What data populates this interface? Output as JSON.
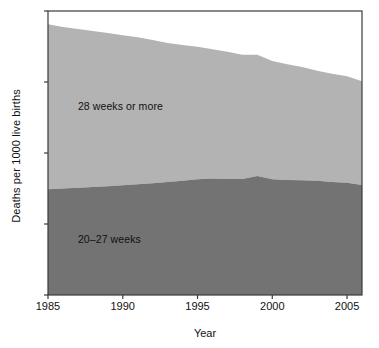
{
  "chart_data": {
    "type": "area",
    "stacked": true,
    "title": "",
    "subtitle": "",
    "xlabel": "Year",
    "ylabel": "Deaths per 1000 live births",
    "xlim": [
      1985,
      2006
    ],
    "ylim": [
      0,
      8
    ],
    "grid": false,
    "legend_position": "inline-annotations",
    "xticks": [
      1985,
      1990,
      1995,
      2000,
      2005
    ],
    "xtick_labels": [
      "1985",
      "1990",
      "1995",
      "2000",
      "2005"
    ],
    "yticks": [
      0,
      2,
      4,
      6,
      8
    ],
    "ytick_labels": [
      "0",
      "2",
      "4",
      "6",
      "8"
    ],
    "x": [
      1985,
      1986,
      1987,
      1988,
      1989,
      1990,
      1991,
      1992,
      1993,
      1994,
      1995,
      1996,
      1997,
      1998,
      1999,
      2000,
      2001,
      2002,
      2003,
      2004,
      2005,
      2006
    ],
    "series": [
      {
        "name": "20-27 weeks",
        "label": "20–27 weeks",
        "color": "#737373",
        "values": [
          2.98,
          3.0,
          3.02,
          3.04,
          3.06,
          3.09,
          3.12,
          3.15,
          3.18,
          3.22,
          3.26,
          3.28,
          3.27,
          3.27,
          3.35,
          3.26,
          3.24,
          3.23,
          3.22,
          3.18,
          3.16,
          3.1
        ]
      },
      {
        "name": "28 weeks or more",
        "label": "28 weeks or more",
        "color": "#b3b3b3",
        "values": [
          4.65,
          4.55,
          4.47,
          4.4,
          4.32,
          4.23,
          4.14,
          4.03,
          3.92,
          3.82,
          3.73,
          3.64,
          3.58,
          3.5,
          3.42,
          3.33,
          3.26,
          3.19,
          3.1,
          3.05,
          3.0,
          2.92
        ]
      }
    ],
    "totals": [
      7.63,
      7.55,
      7.49,
      7.44,
      7.38,
      7.32,
      7.26,
      7.18,
      7.1,
      7.04,
      6.99,
      6.92,
      6.85,
      6.77,
      6.77,
      6.59,
      6.5,
      6.42,
      6.32,
      6.23,
      6.16,
      6.02
    ],
    "annotations": [
      {
        "text": "28 weeks or more",
        "x": 1987.0,
        "y": 5.3
      },
      {
        "text": "20–27 weeks",
        "x": 1987.0,
        "y": 1.55
      }
    ],
    "colors": {
      "upper_band": "#b3b3b3",
      "lower_band": "#737373",
      "axis": "#3b3b3b",
      "text": "#111111",
      "background": "#ffffff"
    }
  }
}
